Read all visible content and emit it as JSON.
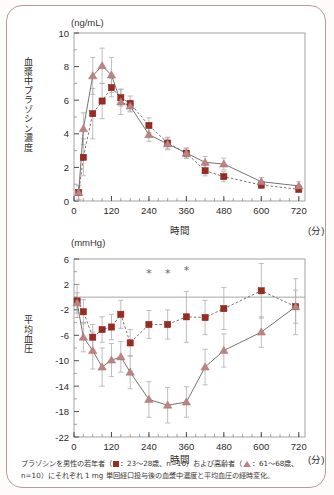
{
  "figure": {
    "caption_line1_pre": "プラゾシンを男性の若年者（",
    "caption_line1_mid": "：23〜28歳、n=10）および高齢者（",
    "caption_line1_post": "：61〜68歳、",
    "caption_line2": "n=10）にそれぞれ 1 mg 単回経口投与後の血漿中濃度と平均血圧の経時変化。",
    "border_color": "#b99a96"
  },
  "legend": {
    "young_marker": "square-marker",
    "young_label": "23〜28歳, n=10",
    "elderly_marker": "triangle-marker",
    "elderly_label": "61〜68歳, n=10",
    "young_color": "#9c2a20",
    "elderly_color": "#bc8382"
  },
  "chart_data": [
    {
      "id": "plasma-concentration",
      "type": "line",
      "title": "",
      "unit_label": "(ng/mL)",
      "ylabel": "血漿中プラゾシン濃度",
      "xlabel": "時間",
      "xunit": "(分)",
      "xlim": [
        0,
        740
      ],
      "ylim": [
        0,
        10
      ],
      "xticks": [
        0,
        120,
        240,
        360,
        480,
        600,
        720
      ],
      "yticks": [
        0,
        2,
        4,
        6,
        8,
        10
      ],
      "grid": false,
      "legend_position": "none",
      "series": [
        {
          "name": "若年者",
          "marker": "square",
          "color": "#9c2a20",
          "linestyle": "dashed",
          "x": [
            15,
            30,
            60,
            90,
            120,
            150,
            180,
            240,
            300,
            360,
            420,
            480,
            600,
            720
          ],
          "values": [
            0.5,
            2.6,
            5.2,
            5.95,
            6.75,
            6.15,
            5.8,
            4.5,
            3.45,
            2.85,
            1.8,
            1.45,
            0.95,
            0.7
          ],
          "err": [
            0.45,
            1.1,
            1.5,
            1.05,
            0.55,
            0.5,
            0.45,
            0.45,
            0.35,
            0.3,
            0.3,
            0.3,
            0.2,
            0.2
          ]
        },
        {
          "name": "高齢者",
          "marker": "triangle",
          "color": "#bc8382",
          "linestyle": "solid",
          "x": [
            15,
            30,
            60,
            90,
            120,
            150,
            180,
            240,
            300,
            360,
            420,
            480,
            600,
            720
          ],
          "values": [
            0.5,
            4.3,
            7.45,
            8.05,
            7.5,
            5.9,
            5.65,
            3.95,
            3.4,
            2.85,
            2.3,
            2.2,
            1.15,
            0.9
          ],
          "err": [
            0.4,
            0.95,
            1.1,
            1.05,
            1.05,
            0.75,
            0.35,
            0.4,
            0.35,
            0.3,
            0.35,
            0.35,
            0.25,
            0.25
          ]
        }
      ]
    },
    {
      "id": "mean-blood-pressure",
      "type": "line",
      "title": "",
      "unit_label": "(mmHg)",
      "ylabel": "平均血圧",
      "xlabel": "時間",
      "xunit": "(分)",
      "xlim": [
        0,
        740
      ],
      "ylim": [
        -22,
        6
      ],
      "xticks": [
        0,
        120,
        240,
        360,
        480,
        600,
        720
      ],
      "yticks": [
        6,
        2,
        -2,
        -6,
        -10,
        -14,
        -18,
        -22
      ],
      "grid": false,
      "reference_line_y": 0,
      "legend_position": "none",
      "annotations": [
        {
          "label": "*",
          "x": 240,
          "y": 3.2
        },
        {
          "label": "*",
          "x": 300,
          "y": 3.2
        },
        {
          "label": "*",
          "x": 360,
          "y": 3.6
        }
      ],
      "series": [
        {
          "name": "若年者",
          "marker": "square",
          "color": "#9c2a20",
          "linestyle": "dashed",
          "x": [
            10,
            30,
            60,
            90,
            120,
            150,
            180,
            240,
            300,
            360,
            420,
            480,
            600,
            710
          ],
          "values": [
            -0.6,
            -2.3,
            -6.3,
            -5.1,
            -4.7,
            -2.7,
            -7.2,
            -4.3,
            -4.3,
            -3.1,
            -3.2,
            -1.8,
            1.0,
            -1.5
          ],
          "err": [
            2.6,
            1.9,
            2.0,
            2.0,
            2.0,
            2.2,
            2.1,
            2.2,
            2.3,
            4.0,
            2.7,
            3.3,
            4.3,
            4.4
          ]
        },
        {
          "name": "高齢者",
          "marker": "triangle",
          "color": "#bc8382",
          "linestyle": "solid",
          "x": [
            10,
            30,
            60,
            90,
            120,
            150,
            180,
            240,
            300,
            360,
            420,
            480,
            600,
            710
          ],
          "values": [
            -0.9,
            -6.3,
            -8.4,
            -11.0,
            -9.9,
            -9.4,
            -11.8,
            -16.1,
            -17.0,
            -16.5,
            -11.0,
            -8.4,
            -5.5,
            -1.5
          ],
          "err": [
            1.6,
            2.3,
            2.9,
            3.0,
            2.6,
            2.4,
            2.6,
            2.8,
            2.8,
            2.4,
            2.8,
            2.6,
            2.4,
            2.6
          ]
        }
      ]
    }
  ]
}
